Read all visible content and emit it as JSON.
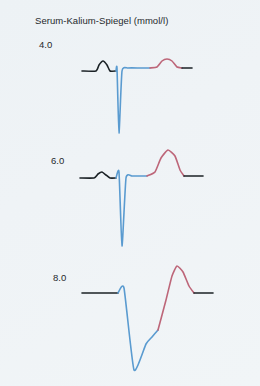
{
  "figure": {
    "title": "Serum-Kalium-Spiegel (mmol/l)",
    "background_color": "#eef3f6"
  },
  "colors": {
    "baseline": "#1b2226",
    "qrs": "#5a9bd0",
    "t_wave": "#bd6679",
    "text": "#25292c"
  },
  "chart_data": {
    "type": "line",
    "title": "Serum-Kalium-Spiegel (mmol/l)",
    "xlabel": "",
    "ylabel": "",
    "grid": false,
    "legend": "none",
    "series": [
      {
        "name": "4.0",
        "level_label": "4.0",
        "description": "Normales EKG: normale P-Welle, schmaler QRS-Komplex, normale T-Welle",
        "segments": [
          {
            "part": "baseline-p-wave",
            "color": "#1b2226",
            "points": [
              [
                82,
                71
              ],
              [
                96,
                71
              ],
              [
                99,
                65
              ],
              [
                103,
                61
              ],
              [
                107,
                65
              ],
              [
                110,
                71
              ],
              [
                116,
                71
              ]
            ]
          },
          {
            "part": "qrs-complex",
            "color": "#5a9bd0",
            "points": [
              [
                116,
                71
              ],
              [
                117,
                68
              ],
              [
                119,
                133
              ],
              [
                122,
                71
              ],
              [
                128,
                68
              ],
              [
                140,
                68
              ],
              [
                150,
                68
              ]
            ]
          },
          {
            "part": "t-wave",
            "color": "#bd6679",
            "points": [
              [
                150,
                68
              ],
              [
                157,
                67
              ],
              [
                162,
                61
              ],
              [
                167,
                59
              ],
              [
                172,
                61
              ],
              [
                177,
                67
              ],
              [
                182,
                68
              ]
            ]
          },
          {
            "part": "baseline-end",
            "color": "#1b2226",
            "points": [
              [
                182,
                68
              ],
              [
                192,
                68
              ]
            ]
          }
        ]
      },
      {
        "name": "6.0",
        "level_label": "6.0",
        "description": "Hyperkaliaemie: hohe spitze T-Welle, abgeflachte P-Welle",
        "segments": [
          {
            "part": "baseline-p-wave",
            "color": "#1b2226",
            "points": [
              [
                80,
                178
              ],
              [
                94,
                178
              ],
              [
                98,
                174
              ],
              [
                102,
                172
              ],
              [
                106,
                175
              ],
              [
                110,
                178
              ],
              [
                116,
                178
              ]
            ]
          },
          {
            "part": "qrs-complex",
            "color": "#5a9bd0",
            "points": [
              [
                116,
                178
              ],
              [
                119,
                172
              ],
              [
                122,
                246
              ],
              [
                126,
                178
              ],
              [
                132,
                176
              ],
              [
                141,
                176
              ],
              [
                147,
                176
              ]
            ]
          },
          {
            "part": "t-wave",
            "color": "#bd6679",
            "points": [
              [
                147,
                176
              ],
              [
                155,
                172
              ],
              [
                161,
                158
              ],
              [
                168,
                150
              ],
              [
                175,
                156
              ],
              [
                180,
                170
              ],
              [
                184,
                176
              ]
            ]
          },
          {
            "part": "baseline-end",
            "color": "#1b2226",
            "points": [
              [
                184,
                176
              ],
              [
                203,
                176
              ]
            ]
          }
        ]
      },
      {
        "name": "8.0",
        "level_label": "8.0",
        "description": "Schwere Hyperkaliaemie: P-Welle fehlt, verbreiterter QRS-Komplex, sehr hohe breite T-Welle",
        "segments": [
          {
            "part": "baseline-flat",
            "color": "#1b2226",
            "points": [
              [
                82,
                293
              ],
              [
                118,
                293
              ]
            ]
          },
          {
            "part": "qrs-complex",
            "color": "#5a9bd0",
            "points": [
              [
                118,
                293
              ],
              [
                124,
                288
              ],
              [
                134,
                370
              ],
              [
                146,
                344
              ],
              [
                152,
                337
              ],
              [
                158,
                330
              ]
            ]
          },
          {
            "part": "t-wave",
            "color": "#bd6679",
            "points": [
              [
                158,
                330
              ],
              [
                166,
                300
              ],
              [
                172,
                276
              ],
              [
                177,
                266
              ],
              [
                183,
                272
              ],
              [
                189,
                286
              ],
              [
                194,
                293
              ]
            ]
          },
          {
            "part": "baseline-end",
            "color": "#1b2226",
            "points": [
              [
                194,
                293
              ],
              [
                213,
                293
              ]
            ]
          }
        ]
      }
    ]
  }
}
